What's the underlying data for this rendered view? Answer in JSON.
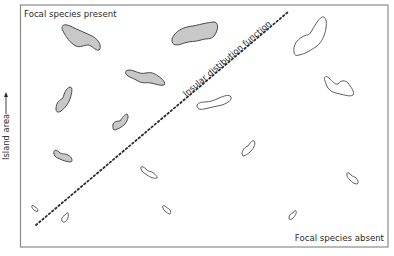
{
  "diagram": {
    "labels": {
      "top_left": "Focal species present",
      "bottom_right": "Focal species absent",
      "y_axis": "Island area",
      "line": "Insular distibution function"
    },
    "colors": {
      "present_fill": "#c8c8c8",
      "outline": "#4a4a4a",
      "frame": "#8a8a8a",
      "text": "#2a2a2a"
    },
    "legend_semantics": {
      "shaded_island": "focal species present",
      "unshaded_island": "focal species absent"
    },
    "islands": [
      {
        "id": "p1",
        "status": "present",
        "size": "large"
      },
      {
        "id": "p2",
        "status": "present",
        "size": "large"
      },
      {
        "id": "p3",
        "status": "present",
        "size": "medium"
      },
      {
        "id": "p4",
        "status": "present",
        "size": "medium"
      },
      {
        "id": "p5",
        "status": "present",
        "size": "small"
      },
      {
        "id": "a1",
        "status": "absent",
        "size": "large"
      },
      {
        "id": "a2",
        "status": "absent",
        "size": "medium"
      },
      {
        "id": "a3",
        "status": "absent",
        "size": "medium"
      },
      {
        "id": "a4",
        "status": "absent",
        "size": "small"
      },
      {
        "id": "a5",
        "status": "absent",
        "size": "small"
      },
      {
        "id": "a6",
        "status": "absent",
        "size": "small"
      },
      {
        "id": "a7",
        "status": "absent",
        "size": "tiny"
      },
      {
        "id": "a8",
        "status": "absent",
        "size": "tiny"
      },
      {
        "id": "a9",
        "status": "absent",
        "size": "tiny"
      },
      {
        "id": "a10",
        "status": "absent",
        "size": "tiny"
      }
    ]
  }
}
